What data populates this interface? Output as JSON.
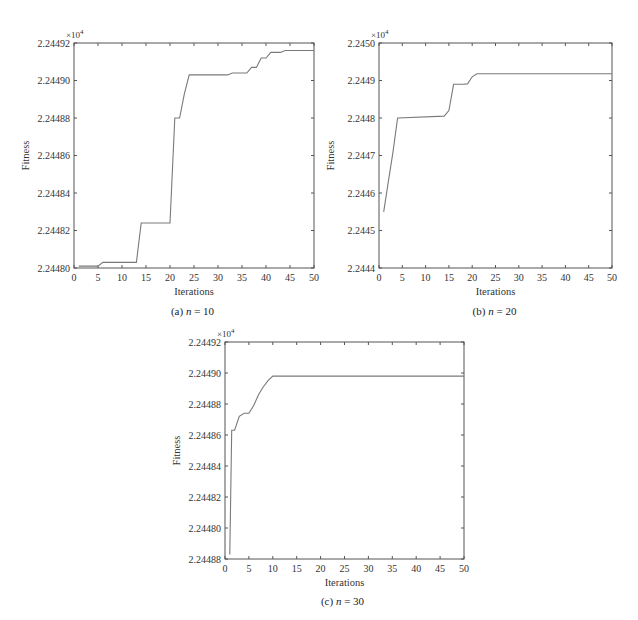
{
  "chart_data": [
    {
      "type": "line",
      "id": "a",
      "caption": "(a)",
      "caption_var": "n",
      "caption_value": "= 10",
      "xlabel": "Iterations",
      "ylabel": "Fitness",
      "y_multiplier": "×10",
      "y_multiplier_exp": "4",
      "xlim": [
        0,
        50
      ],
      "ylim": [
        2.2448,
        2.24492
      ],
      "xticks": [
        "0",
        "5",
        "10",
        "15",
        "20",
        "25",
        "30",
        "35",
        "40",
        "45",
        "50"
      ],
      "yticks": [
        "2.24480",
        "2.24482",
        "2.24484",
        "2.24486",
        "2.24488",
        "2.24490",
        "2.24492"
      ],
      "grid": false,
      "color": "#7a7a7a",
      "x": [
        1,
        5,
        6,
        13,
        14,
        20,
        21,
        22,
        23,
        24,
        25,
        32,
        33,
        36,
        37,
        38,
        39,
        40,
        41,
        43,
        44,
        50
      ],
      "values": [
        2.244801,
        2.244801,
        2.244803,
        2.244803,
        2.244824,
        2.244824,
        2.24488,
        2.24488,
        2.244893,
        2.244903,
        2.244903,
        2.244903,
        2.244904,
        2.244904,
        2.244907,
        2.244907,
        2.244912,
        2.244912,
        2.244915,
        2.244915,
        2.244916,
        2.244916
      ]
    },
    {
      "type": "line",
      "id": "b",
      "caption": "(b)",
      "caption_var": "n",
      "caption_value": "= 20",
      "xlabel": "Iterations",
      "ylabel": "Fitness",
      "y_multiplier": "×10",
      "y_multiplier_exp": "4",
      "xlim": [
        0,
        50
      ],
      "ylim": [
        2.2444,
        2.245
      ],
      "xticks": [
        "0",
        "5",
        "10",
        "15",
        "20",
        "25",
        "30",
        "35",
        "40",
        "45",
        "50"
      ],
      "yticks": [
        "2.2444",
        "2.2445",
        "2.2446",
        "2.2447",
        "2.2448",
        "2.2449",
        "2.2450"
      ],
      "grid": false,
      "color": "#7a7a7a",
      "x": [
        1,
        2,
        3,
        4,
        14,
        15,
        16,
        18,
        19,
        20,
        21,
        50
      ],
      "values": [
        2.24455,
        2.24463,
        2.24471,
        2.2448,
        2.244805,
        2.24482,
        2.24489,
        2.24489,
        2.244891,
        2.24491,
        2.244918,
        2.244918
      ]
    },
    {
      "type": "line",
      "id": "c",
      "caption": "(c)",
      "caption_var": "n",
      "caption_value": "= 30",
      "xlabel": "Iterations",
      "ylabel": "Fitness",
      "y_multiplier": "×10",
      "y_multiplier_exp": "4",
      "xlim": [
        0,
        50
      ],
      "ylim": [
        2.24478,
        2.24492
      ],
      "xticks": [
        "0",
        "5",
        "10",
        "15",
        "20",
        "25",
        "30",
        "35",
        "40",
        "45",
        "50"
      ],
      "yticks": [
        "2.24488",
        "2.24480",
        "2.24482",
        "2.24484",
        "2.24486",
        "2.24488",
        "2.24490",
        "2.24492"
      ],
      "ytick_values": [
        2.24478,
        2.2448,
        2.24482,
        2.24484,
        2.24486,
        2.24488,
        2.2449,
        2.24492
      ],
      "grid": false,
      "color": "#7a7a7a",
      "x": [
        1,
        1.4,
        2,
        3,
        4,
        5,
        6,
        7,
        8,
        9,
        10,
        50
      ],
      "values": [
        2.244783,
        2.244863,
        2.244863,
        2.244872,
        2.244874,
        2.244874,
        2.244879,
        2.244886,
        2.244891,
        2.244895,
        2.244898,
        2.244898
      ]
    }
  ]
}
